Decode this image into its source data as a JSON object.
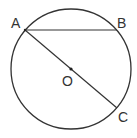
{
  "diagram": {
    "type": "geometry-circle",
    "stroke_color": "#333333",
    "background": "#ffffff",
    "circle": {
      "center_label": "O",
      "cx": 71,
      "cy": 69,
      "r": 60
    },
    "points": {
      "A": {
        "label": "A",
        "x": 25,
        "y": 30
      },
      "B": {
        "label": "B",
        "x": 117,
        "y": 30
      },
      "C": {
        "label": "C",
        "x": 117,
        "y": 108
      },
      "O": {
        "label": "O",
        "x": 71,
        "y": 69
      }
    },
    "segments": [
      {
        "from": "A",
        "to": "B",
        "name": "chord-AB"
      },
      {
        "from": "A",
        "to": "C",
        "name": "diameter-AC"
      }
    ]
  }
}
